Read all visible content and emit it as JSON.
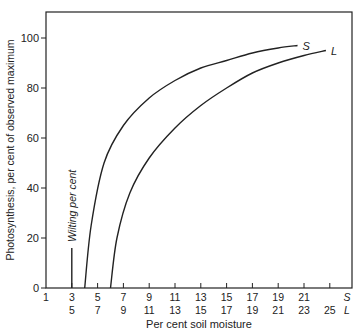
{
  "chart_data": {
    "type": "line",
    "title": "",
    "ylabel": "Photosynthesis, per cent of observed maximum",
    "xlabel": "Per cent soil moisture",
    "ylim": [
      0,
      110
    ],
    "yticks": [
      0,
      20,
      40,
      60,
      80,
      100
    ],
    "x_axis_S": {
      "label": "S",
      "ticks": [
        1,
        3,
        5,
        7,
        9,
        11,
        13,
        15,
        17,
        19,
        21
      ]
    },
    "x_axis_L": {
      "label": "L",
      "ticks": [
        5,
        7,
        9,
        11,
        13,
        15,
        17,
        19,
        21,
        23,
        25
      ]
    },
    "grid": false,
    "annotations": [
      {
        "text": "Wilting per cent",
        "x_S": 3,
        "y_top": 16
      }
    ],
    "series": [
      {
        "name": "S",
        "x_S": [
          4.0,
          4.5,
          5.5,
          7,
          9,
          11,
          13,
          15,
          17,
          19,
          20.5
        ],
        "values": [
          0,
          25,
          50,
          65,
          76,
          83,
          88,
          91,
          94,
          96,
          97
        ]
      },
      {
        "name": "L",
        "x_S": [
          6.0,
          6.5,
          7.5,
          9,
          11,
          13,
          15,
          17,
          19,
          21,
          22.7
        ],
        "values": [
          0,
          20,
          38,
          52,
          64,
          73,
          80,
          86,
          90,
          93,
          95
        ]
      }
    ]
  }
}
